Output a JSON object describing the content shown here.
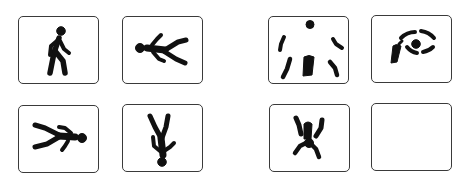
{
  "figure": {
    "colors": {
      "border": "#3a3a3a",
      "icon": "#111111",
      "background": "#ffffff"
    },
    "left_group": {
      "tiles": [
        {
          "icon": "walking-person-icon",
          "label": "walking person"
        },
        {
          "icon": "falling-person-forward-icon",
          "label": "person falling, lying face-down"
        },
        {
          "icon": "falling-person-backward-icon",
          "label": "person lying, head to the right"
        },
        {
          "icon": "upside-down-person-icon",
          "label": "person upside down"
        }
      ]
    },
    "right_group": {
      "tiles": [
        {
          "icon": "fragmented-figure-icon",
          "label": "fragmented figure parts"
        },
        {
          "icon": "eye-fragment-icon",
          "label": "eye-like fragments"
        },
        {
          "icon": "tumbling-figure-icon",
          "label": "tumbling figure"
        },
        {
          "icon": "empty-tile",
          "label": "empty"
        }
      ]
    }
  }
}
